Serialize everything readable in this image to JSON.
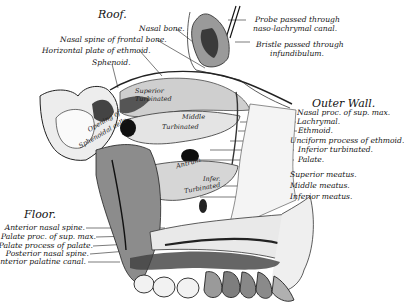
{
  "figure": {
    "headings": {
      "roof": "Roof.",
      "outer_wall": "Outer Wall.",
      "floor": "Floor."
    },
    "roof_labels": [
      "Nasal bone.",
      "Nasal spine of frontal bone.",
      "Horizontal plate of ethmoid.",
      "Sphenoid."
    ],
    "top_right_labels": [
      {
        "line1": "Probe passed through",
        "line2": "naso-lachrymal canal."
      },
      {
        "line1": "Bristle passed through",
        "line2": "infundibulum."
      }
    ],
    "outer_wall_labels": [
      "Nasal proc. of sup. max.",
      "Lachrymal.",
      "Ethmoid.",
      "Unciform process of ethmoid.",
      "Inferior turbinated.",
      "Palate."
    ],
    "meatus_labels": [
      "Superior meatus.",
      "Middle meatus.",
      "Inferior meatus."
    ],
    "floor_labels": [
      "Anterior nasal spine.",
      "Palate proc. of sup. max.",
      "Palate process of palate.",
      "Posterior nasal spine.",
      "Anterior palatine canal."
    ],
    "inner_labels": {
      "sphenoidal_1": "Opening of",
      "sphenoidal_2": "Sphenoidal cells",
      "superior_turb_1": "Superior",
      "superior_turb_2": "Turbinated",
      "middle_turb_1": "Middle",
      "middle_turb_2": "Turbinated",
      "antrum": "Antrum",
      "inferior_turb_1": "Infer.",
      "inferior_turb_2": "Turbinated"
    }
  }
}
